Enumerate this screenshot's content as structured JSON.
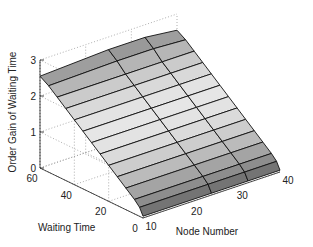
{
  "chart_data": {
    "type": "surface3d",
    "title": "",
    "xlabel": "Node Number",
    "ylabel": "Waiting Time",
    "zlabel": "Order Gain of Waiting Time",
    "x_ticks": [
      10,
      20,
      30,
      40
    ],
    "y_ticks": [
      0,
      20,
      40,
      60
    ],
    "z_ticks": [
      0,
      1,
      2,
      3
    ],
    "xlim": [
      10,
      40
    ],
    "ylim": [
      0,
      60
    ],
    "zlim": [
      0,
      3
    ],
    "grid": true,
    "colormap": "gray",
    "x": [
      10,
      25,
      33,
      40
    ],
    "y": [
      0,
      2,
      5,
      10,
      15,
      20,
      25,
      30,
      35,
      40,
      45,
      50,
      55,
      60
    ],
    "z_note": "Order gain rises roughly linearly with waiting time, nearly constant across node number",
    "z": [
      [
        0.05,
        0.05,
        0.05,
        0.05
      ],
      [
        0.25,
        0.25,
        0.25,
        0.25
      ],
      [
        0.4,
        0.4,
        0.4,
        0.4
      ],
      [
        0.6,
        0.6,
        0.6,
        0.6
      ],
      [
        0.8,
        0.8,
        0.8,
        0.8
      ],
      [
        1.0,
        1.0,
        1.0,
        1.0
      ],
      [
        1.2,
        1.2,
        1.2,
        1.2
      ],
      [
        1.4,
        1.4,
        1.4,
        1.4
      ],
      [
        1.6,
        1.6,
        1.6,
        1.6
      ],
      [
        1.8,
        1.8,
        1.8,
        1.8
      ],
      [
        2.0,
        2.0,
        2.0,
        2.0
      ],
      [
        2.2,
        2.2,
        2.2,
        2.2
      ],
      [
        2.4,
        2.45,
        2.45,
        2.4
      ],
      [
        2.55,
        2.65,
        2.65,
        2.55
      ]
    ]
  },
  "labels": {
    "xlabel": "Node Number",
    "ylabel": "Waiting Time",
    "zlabel": "Order Gain of Waiting Time"
  },
  "ticks": {
    "x": [
      "10",
      "20",
      "30",
      "40"
    ],
    "y": [
      "0",
      "20",
      "40",
      "60"
    ],
    "z": [
      "0",
      "1",
      "2",
      "3"
    ]
  }
}
